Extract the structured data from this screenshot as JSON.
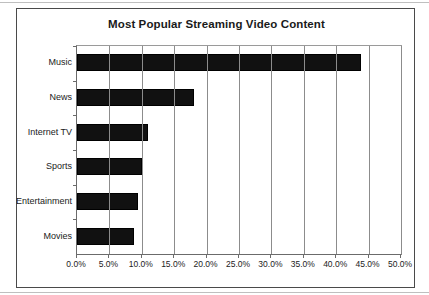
{
  "page": {
    "background_color": "#ffffff",
    "frame_border_color": "#4a4a4a"
  },
  "chart_data": {
    "type": "bar",
    "orientation": "horizontal",
    "title": "Most Popular Streaming Video Content",
    "xlabel": "",
    "ylabel": "",
    "categories": [
      "Music",
      "News",
      "Internet TV",
      "Sports",
      "Entertainment",
      "Movies"
    ],
    "values": [
      43.8,
      18.0,
      11.0,
      10.0,
      9.4,
      8.8
    ],
    "value_format": "percent",
    "xlim": [
      0,
      50
    ],
    "xticks": [
      0,
      5,
      10,
      15,
      20,
      25,
      30,
      35,
      40,
      45,
      50
    ],
    "xtick_labels": [
      "0.0%",
      "5.0%",
      "10.0%",
      "15.0%",
      "20.0%",
      "25.0%",
      "30.0%",
      "35.0%",
      "40.0%",
      "45.0%",
      "50.0%"
    ],
    "grid": true,
    "grid_axis": "x",
    "legend": false,
    "bar_color": "#111111",
    "bar_edge_color": "#000000",
    "gridline_color": "#8c8c8c",
    "axis_color": "#6b6b6b",
    "title_color": "#1a1a1a",
    "label_color": "#222222"
  }
}
